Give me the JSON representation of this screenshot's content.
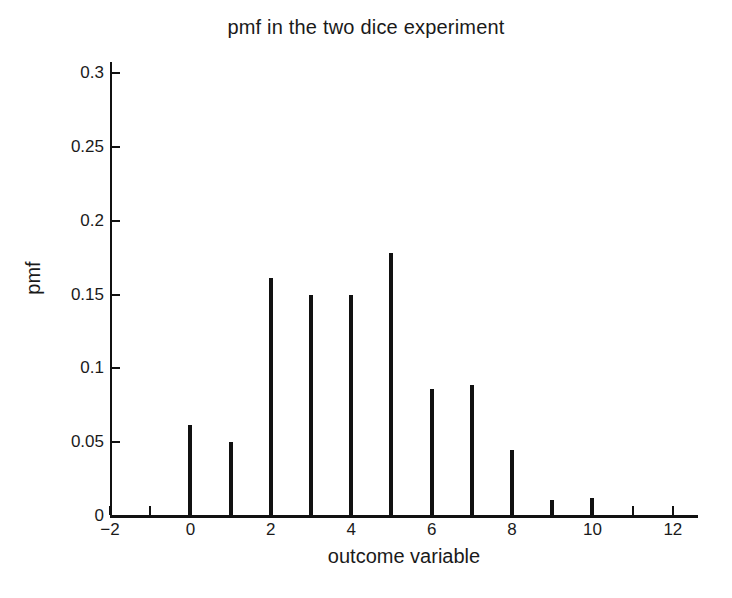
{
  "chart_data": {
    "type": "bar",
    "title": "pmf in the two dice experiment",
    "xlabel": "outcome variable",
    "ylabel": "pmf",
    "x": [
      0,
      1,
      2,
      3,
      4,
      5,
      6,
      7,
      8,
      9,
      10
    ],
    "values": [
      0.062,
      0.05,
      0.161,
      0.15,
      0.15,
      0.178,
      0.086,
      0.089,
      0.045,
      0.011,
      0.012
    ],
    "categories": [
      "0",
      "1",
      "2",
      "3",
      "4",
      "5",
      "6",
      "7",
      "8",
      "9",
      "10"
    ],
    "xlim": [
      -2,
      12.6
    ],
    "ylim": [
      0,
      0.3076
    ],
    "xticks": [
      -2,
      0,
      2,
      4,
      6,
      8,
      10,
      12
    ],
    "xtick_labels": [
      "−2",
      "0",
      "2",
      "4",
      "6",
      "8",
      "10",
      "12"
    ],
    "xticks_minor": [
      -1,
      1,
      3,
      5,
      7,
      9,
      11
    ],
    "yticks": [
      0,
      0.05,
      0.1,
      0.15,
      0.2,
      0.25,
      0.3
    ],
    "ytick_labels": [
      "0",
      "0.05",
      "0.1",
      "0.15",
      "0.2",
      "0.25",
      "0.3"
    ],
    "grid": false,
    "legend": null,
    "marker_style": "stem",
    "line_color": "#111111",
    "background_color": "#ffffff"
  }
}
